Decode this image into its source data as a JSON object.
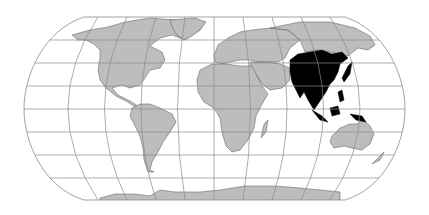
{
  "map": {
    "projection": "Robinson",
    "highlighted_region": "Asia",
    "colors": {
      "background": "#ffffff",
      "land": "#bdbdbd",
      "highlight": "#000000",
      "graticule": "#8a8a8a",
      "coastline": "#555555"
    },
    "regions": [
      "North America",
      "South America",
      "Europe",
      "Africa",
      "Asia",
      "Oceania",
      "Antarctica"
    ],
    "graticule": {
      "parallel_spacing_deg": 15,
      "meridian_spacing_deg": 20
    }
  }
}
